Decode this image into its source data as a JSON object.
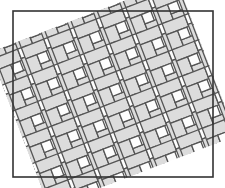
{
  "figure": {
    "canvas": {
      "width": 225,
      "height": 188,
      "background": "#ffffff"
    }
  },
  "frame": {
    "name": "pattern-border",
    "x": 13,
    "y": 11,
    "width": 200,
    "height": 166,
    "stroke": "#333333",
    "stroke_width": 1.6,
    "fill": "#ffffff"
  },
  "pattern": {
    "type": "basketweave",
    "rotation_deg": -21,
    "unit_cell": 28,
    "rect_long": 24,
    "rect_short": 12,
    "insert_size": 10,
    "gap": 1.6,
    "tile_fill": "#dcdcdc",
    "insert_fill": "#fdfdfd",
    "grout_stroke": "#555555",
    "grout_width": 1.3,
    "cols": 17,
    "rows": 15,
    "origin_x": -180,
    "origin_y": -150
  }
}
